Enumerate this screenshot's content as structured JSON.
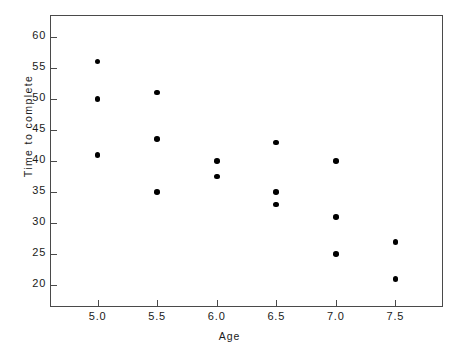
{
  "chart_data": {
    "type": "scatter",
    "title": "",
    "xlabel": "Age",
    "ylabel": "Time to complete",
    "xlim": [
      4.6,
      7.9
    ],
    "ylim": [
      16.5,
      63.5
    ],
    "grid": false,
    "legend": null,
    "marker": "filled-circle",
    "marker_color": "#000000",
    "xticks": [
      5.0,
      5.5,
      6.0,
      6.5,
      7.0,
      7.5
    ],
    "xtick_labels": [
      "5.0",
      "5.5",
      "6.0",
      "6.5",
      "7.0",
      "7.5"
    ],
    "yticks": [
      20,
      25,
      30,
      35,
      40,
      45,
      50,
      55,
      60
    ],
    "ytick_labels": [
      "20",
      "25",
      "30",
      "35",
      "40",
      "45",
      "50",
      "55",
      "60"
    ],
    "points": [
      {
        "x": 5.0,
        "y": 56.0
      },
      {
        "x": 5.0,
        "y": 50.0
      },
      {
        "x": 5.0,
        "y": 41.0
      },
      {
        "x": 5.5,
        "y": 51.0
      },
      {
        "x": 5.5,
        "y": 43.5
      },
      {
        "x": 5.5,
        "y": 35.0
      },
      {
        "x": 6.0,
        "y": 40.0
      },
      {
        "x": 6.0,
        "y": 37.5
      },
      {
        "x": 6.5,
        "y": 43.0
      },
      {
        "x": 6.5,
        "y": 35.0
      },
      {
        "x": 6.5,
        "y": 33.0
      },
      {
        "x": 7.0,
        "y": 40.0
      },
      {
        "x": 7.0,
        "y": 31.0
      },
      {
        "x": 7.0,
        "y": 25.0
      },
      {
        "x": 7.5,
        "y": 27.0
      },
      {
        "x": 7.5,
        "y": 21.0
      }
    ]
  }
}
